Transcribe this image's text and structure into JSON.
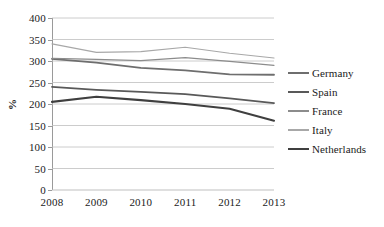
{
  "chart_data": {
    "type": "line",
    "title": "",
    "xlabel": "",
    "ylabel": "%",
    "categories": [
      "2008",
      "2009",
      "2010",
      "2011",
      "2012",
      "2013"
    ],
    "x": [
      2008,
      2009,
      2010,
      2011,
      2012,
      2013
    ],
    "ylim": [
      0,
      400
    ],
    "y_ticks": [
      0,
      50,
      100,
      150,
      200,
      250,
      300,
      350,
      400
    ],
    "y_tick_labels": [
      "0",
      "50",
      "100",
      "150",
      "200",
      "250",
      "300",
      "350",
      "400"
    ],
    "grid": true,
    "grid_axis": "y",
    "legend_position": "right",
    "series": [
      {
        "name": "Germany",
        "color": "#6e6e6e",
        "width": 1.8,
        "values": [
          305,
          296,
          284,
          278,
          269,
          268
        ]
      },
      {
        "name": "Spain",
        "color": "#595959",
        "width": 1.8,
        "values": [
          240,
          233,
          228,
          223,
          213,
          202
        ]
      },
      {
        "name": "France",
        "color": "#8c8c8c",
        "width": 1.2,
        "values": [
          306,
          304,
          301,
          308,
          299,
          290
        ]
      },
      {
        "name": "Italy",
        "color": "#a8a8a8",
        "width": 1.2,
        "values": [
          340,
          320,
          322,
          332,
          318,
          307
        ]
      },
      {
        "name": "Netherlands",
        "color": "#3f3f3f",
        "width": 2.1,
        "values": [
          205,
          217,
          209,
          200,
          189,
          161
        ]
      }
    ],
    "style": {
      "gridline_color": "#bfbfbf",
      "axis_color": "#9a9a9a",
      "background": "#ffffff",
      "text_color": "#1a1a1a"
    }
  }
}
